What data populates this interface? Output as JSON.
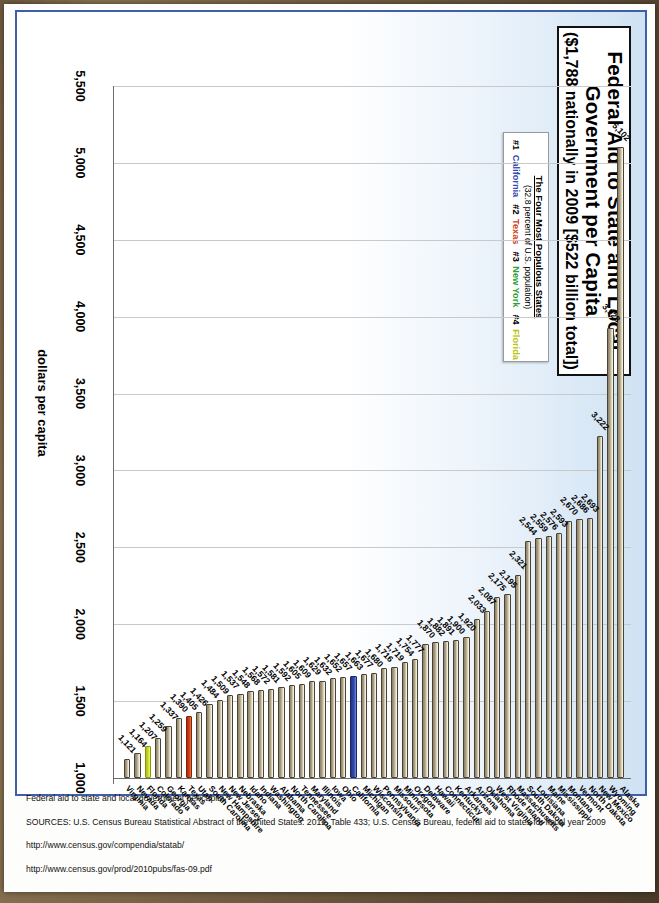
{
  "title": {
    "line1": "Federal Aid to State and Local",
    "line2": "Government per Capita",
    "line3": "($1,788 nationally in 2009 [$522 billion total])"
  },
  "legend": {
    "heading": "The Four Most Populous States",
    "subheading": "(32.8 percent of U.S. population)",
    "items": [
      {
        "rank": "#1",
        "state": "California",
        "color": "#2f49b0"
      },
      {
        "rank": "#2",
        "state": "Texas",
        "color": "#d2401a"
      },
      {
        "rank": "#3",
        "state": "New York",
        "color": "#2ba037"
      },
      {
        "rank": "#4",
        "state": "Florida",
        "color": "#b6c40f"
      }
    ]
  },
  "axis": {
    "title": "dollars per capita",
    "ticks": [
      "5,500",
      "5,000",
      "4,500",
      "4,000",
      "3,500",
      "3,000",
      "2,500",
      "2,000",
      "1,500",
      "1,000"
    ],
    "min": 1000,
    "max": 5500
  },
  "notes": [
    "Federal aid to state and local government per capita.",
    "SOURCES: U.S. Census Bureau Statistical Abstract of the United States: 2012, Table 433; U.S. Census Bureau, federal aid to states for fiscal year 2009",
    "http://www.census.gov/compendia/statab/",
    "http://www.census.gov/prod/2010pubs/fas-09.pdf"
  ],
  "chart_data": {
    "type": "bar",
    "title": "Federal Aid to State and Local Government per Capita",
    "subtitle": "($1,788 nationally in 2009 [$522 billion total])",
    "xlabel": "",
    "ylabel": "dollars per capita",
    "ylim": [
      1000,
      5500
    ],
    "grid": true,
    "orientation": "horizontal",
    "legend_position": "top-left",
    "categories": [
      "Alaska",
      "Wyoming",
      "New Mexico",
      "North Dakota",
      "Vermont",
      "Montana",
      "Mississippi",
      "Maine",
      "Louisiana",
      "South Dakota",
      "Massachusetts",
      "Rhode Island",
      "West Virginia",
      "Oklahoma",
      "Arizona",
      "Arkansas",
      "Kentucky",
      "Connecticut",
      "Hawaii",
      "Delaware",
      "Oregon",
      "Minnesota",
      "Missouri",
      "Pennsylvania",
      "Wisconsin",
      "Michigan",
      "California",
      "Ohio",
      "Iowa",
      "Illinois",
      "Maryland",
      "Tennessee",
      "North Carolina",
      "Alabama",
      "Washington",
      "Indiana",
      "Idaho",
      "Nebraska",
      "New Jersey",
      "New Hampshire",
      "South Carolina",
      "Utah",
      "Texas",
      "Kansas",
      "Georgia",
      "Colorado",
      "Florida",
      "Nevada",
      "Virginia"
    ],
    "values": [
      5102,
      3928,
      3222,
      2693,
      2686,
      2670,
      2593,
      2576,
      2559,
      2544,
      2321,
      2195,
      2175,
      2087,
      2033,
      1920,
      1900,
      1891,
      1882,
      1870,
      1777,
      1754,
      1719,
      1716,
      1680,
      1677,
      1663,
      1657,
      1652,
      1632,
      1629,
      1609,
      1605,
      1592,
      1581,
      1572,
      1568,
      1548,
      1537,
      1509,
      1484,
      1426,
      1405,
      1390,
      1337,
      1259,
      1207,
      1164,
      1121
    ],
    "highlight": {
      "California": "#2f49b0",
      "Texas": "#d2401a",
      "New York": "#2ba037",
      "Florida": "#b6c40f"
    },
    "note_new_york_value": 2693
  }
}
